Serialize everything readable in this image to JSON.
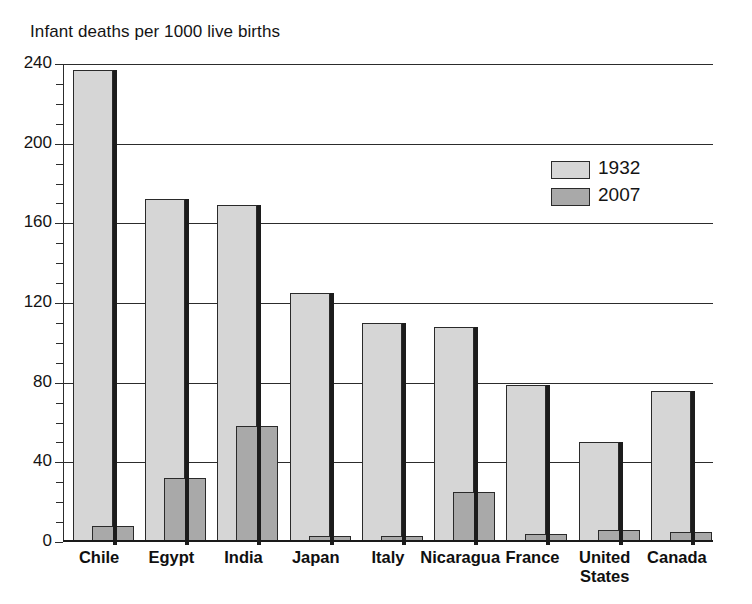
{
  "chart_data": {
    "type": "bar",
    "title": "Infant deaths per 1000 live births",
    "xlabel": "",
    "ylabel": "",
    "ylim": [
      0,
      240
    ],
    "ytick_step": 40,
    "yminor_step": 10,
    "grid": true,
    "legend_position": "upper-right-inside",
    "categories": [
      "Chile",
      "Egypt",
      "India",
      "Japan",
      "Italy",
      "Nicaragua",
      "France",
      "United\nStates",
      "Canada"
    ],
    "yticks": [
      "0",
      "40",
      "80",
      "120",
      "160",
      "200",
      "240"
    ],
    "series": [
      {
        "name": "1932",
        "color": "#d6d6d6",
        "values": [
          237,
          172,
          169,
          125,
          110,
          108,
          79,
          50,
          76
        ]
      },
      {
        "name": "2007",
        "color": "#a9a9a9",
        "values": [
          8,
          32,
          58,
          3,
          3,
          25,
          4,
          6,
          5
        ]
      }
    ]
  },
  "colors": {
    "bar_1932": "#d6d6d6",
    "bar_2007": "#a9a9a9",
    "outline": "#2a2a2a",
    "axis": "#2c2c2c",
    "text": "#141414",
    "background": "#ffffff"
  }
}
